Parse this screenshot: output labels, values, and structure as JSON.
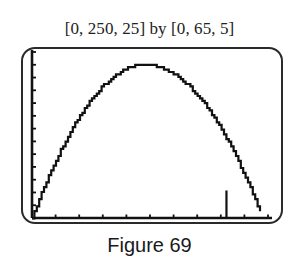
{
  "header": {
    "window_label": "[0, 250, 25] by [0, 65, 5]"
  },
  "caption": "Figure 69",
  "chart_data": {
    "type": "line",
    "title": "[0, 250, 25] by [0, 65, 5]",
    "xlabel": "",
    "ylabel": "",
    "xlim": [
      0,
      250
    ],
    "ylim": [
      0,
      65
    ],
    "x_tick_step": 25,
    "y_tick_step": 5,
    "grid": false,
    "legend": null,
    "series": [
      {
        "name": "parabola",
        "x": [
          0,
          20,
          40,
          60,
          80,
          100,
          120,
          140,
          160,
          180,
          200,
          220,
          244
        ],
        "values": [
          0,
          18,
          33,
          45,
          53,
          58,
          60,
          58,
          53,
          45,
          33,
          18,
          0
        ]
      }
    ],
    "annotations": [
      {
        "type": "vertical_marker",
        "x": 206,
        "y_from": 0,
        "y_to": 10
      }
    ],
    "caption": "Figure 69"
  }
}
